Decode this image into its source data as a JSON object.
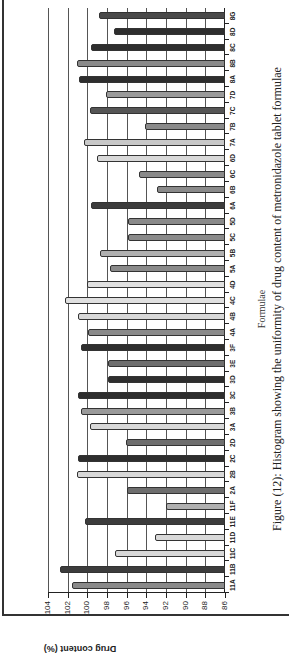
{
  "chart_data": {
    "type": "bar",
    "orientation_in_image": "rotated 90 degrees counter-clockwise",
    "title": "",
    "caption": "Figure (12): Histogram showing the uniformity of drug content of metronidazole tablet formulae",
    "xlabel": "Formulae",
    "ylabel": "Drug content (%)",
    "ylim": [
      86,
      104
    ],
    "yticks": [
      86,
      88,
      90,
      92,
      94,
      96,
      98,
      100,
      102,
      104
    ],
    "grid": true,
    "legend": null,
    "categories": [
      "11A",
      "11B",
      "11C",
      "11D",
      "11E",
      "11F",
      "2A",
      "2B",
      "2C",
      "2D",
      "3A",
      "3B",
      "3C",
      "3D",
      "3E",
      "3F",
      "4A",
      "4B",
      "4C",
      "4D",
      "5A",
      "5B",
      "5C",
      "5D",
      "6A",
      "6B",
      "6C",
      "6D",
      "7A",
      "7B",
      "7C",
      "7D",
      "8A",
      "8B",
      "8C",
      "8D",
      "8G"
    ],
    "values": [
      101.6,
      102.8,
      97.2,
      93.1,
      100.2,
      92.0,
      96.0,
      101.1,
      100.9,
      96.1,
      99.7,
      100.6,
      100.9,
      97.9,
      97.9,
      100.6,
      99.9,
      101.0,
      102.3,
      100.0,
      97.7,
      98.7,
      95.9,
      95.9,
      99.6,
      92.9,
      94.7,
      99.0,
      100.3,
      94.1,
      99.7,
      98.1,
      100.8,
      101.1,
      99.6,
      97.3,
      98.8
    ],
    "bar_colors": [
      "#8a8a8a",
      "#3c3c3c",
      "#d8d8d8",
      "#d8d8d8",
      "#3c3c3c",
      "#b0b0b0",
      "#6e6e6e",
      "#d8d8d8",
      "#2e2e2e",
      "#6e6e6e",
      "#d8d8d8",
      "#9a9a9a",
      "#2e2e2e",
      "#2e2e2e",
      "#6e6e6e",
      "#2e2e2e",
      "#8a8a8a",
      "#d8d8d8",
      "#e0e0e0",
      "#e0e0e0",
      "#8a8a8a",
      "#b0b0b0",
      "#8a8a8a",
      "#8a8a8a",
      "#3c3c3c",
      "#8a8a8a",
      "#8a8a8a",
      "#d8d8d8",
      "#c8c8c8",
      "#8a8a8a",
      "#555555",
      "#9a9a9a",
      "#2e2e2e",
      "#8a8a8a",
      "#2e2e2e",
      "#2e2e2e",
      "#4a4a4a"
    ]
  }
}
